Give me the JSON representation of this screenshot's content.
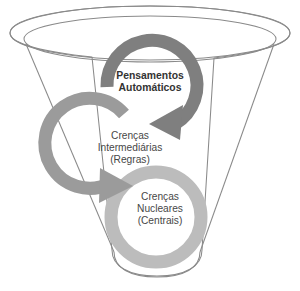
{
  "diagram": {
    "type": "funnel-with-cyclic-arrows",
    "background_color": "#ffffff",
    "funnel": {
      "name": "cone-funnel",
      "outline_color": "#8a8a8a",
      "outline_width": 1,
      "fill": "none",
      "rim_outer_label": "borda externa do funil",
      "rim_inner_label": "borda interna do funil"
    },
    "levels": [
      {
        "id": "automatic-thoughts",
        "order": 1,
        "lines": [
          "Pensamentos",
          "Automáticos"
        ],
        "ring_color": "#7f7f7f",
        "ring_name": "dark-gray-cycle-arrow",
        "has_arrowhead": true,
        "arrow_direction": "clockwise-down-left",
        "text_color": "#333333",
        "bold": true
      },
      {
        "id": "intermediate-beliefs",
        "order": 2,
        "lines": [
          "Crenças",
          "Intermediárias",
          "(Regras)"
        ],
        "ring_color": "#9b9b9b",
        "ring_name": "medium-gray-cycle-arrow",
        "has_arrowhead": true,
        "arrow_direction": "clockwise-down-right",
        "text_color": "#474747",
        "bold": false
      },
      {
        "id": "core-beliefs",
        "order": 3,
        "lines": [
          "Crenças",
          "Nucleares",
          "(Centrais)"
        ],
        "ring_color": "#bcbcbc",
        "ring_name": "light-gray-cycle-ring",
        "has_arrowhead": false,
        "arrow_direction": "none",
        "text_color": "#474747",
        "bold": false
      }
    ]
  }
}
